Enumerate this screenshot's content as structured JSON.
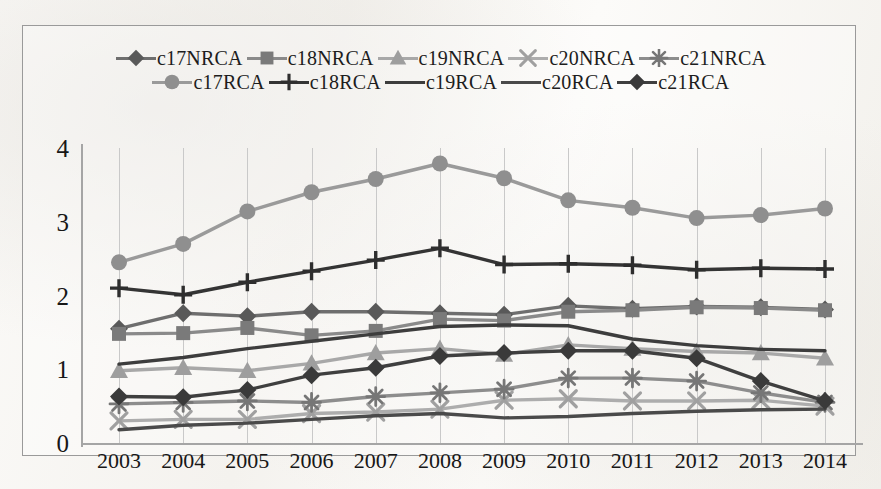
{
  "chart_data": {
    "type": "line",
    "title": "",
    "xlabel": "",
    "ylabel": "",
    "ylim": [
      0,
      4
    ],
    "yticks": [
      0,
      1,
      2,
      3,
      4
    ],
    "grid": "vertical",
    "legend_position": "top",
    "categories": [
      "2003",
      "2004",
      "2005",
      "2006",
      "2007",
      "2008",
      "2009",
      "2010",
      "2011",
      "2012",
      "2013",
      "2014"
    ],
    "series": [
      {
        "name": "c17NRCA",
        "marker": "diamond",
        "color": "#595959",
        "line_color": "#6e6e6e",
        "values": [
          1.55,
          1.76,
          1.72,
          1.78,
          1.78,
          1.76,
          1.74,
          1.86,
          1.82,
          1.85,
          1.84,
          1.81
        ]
      },
      {
        "name": "c18NRCA",
        "marker": "square",
        "color": "#7a7a7a",
        "line_color": "#8a8a8a",
        "values": [
          1.48,
          1.49,
          1.56,
          1.46,
          1.52,
          1.68,
          1.66,
          1.78,
          1.8,
          1.84,
          1.83,
          1.8
        ]
      },
      {
        "name": "c19NRCA",
        "marker": "triangle",
        "color": "#9e9e9e",
        "line_color": "#a8a8a8",
        "values": [
          0.98,
          1.02,
          0.98,
          1.08,
          1.22,
          1.28,
          1.2,
          1.33,
          1.28,
          1.24,
          1.22,
          1.15
        ]
      },
      {
        "name": "c20NRCA",
        "marker": "x",
        "color": "#a0a0a0",
        "line_color": "#adadad",
        "values": [
          0.3,
          0.32,
          0.32,
          0.4,
          0.42,
          0.46,
          0.58,
          0.6,
          0.57,
          0.57,
          0.58,
          0.5
        ]
      },
      {
        "name": "c21NRCA",
        "marker": "asterisk",
        "color": "#767676",
        "line_color": "#8d8d8d",
        "values": [
          0.53,
          0.55,
          0.57,
          0.55,
          0.63,
          0.68,
          0.73,
          0.88,
          0.88,
          0.84,
          0.68,
          0.55
        ]
      },
      {
        "name": "c17RCA",
        "marker": "circle",
        "color": "#8f8f8f",
        "line_color": "#9a9a9a",
        "values": [
          2.45,
          2.7,
          3.14,
          3.4,
          3.58,
          3.79,
          3.59,
          3.29,
          3.19,
          3.05,
          3.09,
          3.18
        ]
      },
      {
        "name": "c18RCA",
        "marker": "plus",
        "color": "#2e2e2e",
        "line_color": "#343434",
        "values": [
          2.1,
          2.01,
          2.18,
          2.33,
          2.48,
          2.64,
          2.42,
          2.43,
          2.41,
          2.35,
          2.37,
          2.36
        ]
      },
      {
        "name": "c19RCA",
        "marker": "none",
        "color": "#3d3d3d",
        "line_color": "#3d3d3d",
        "values": [
          1.07,
          1.16,
          1.28,
          1.38,
          1.48,
          1.58,
          1.6,
          1.59,
          1.41,
          1.32,
          1.27,
          1.25
        ]
      },
      {
        "name": "c20RCA",
        "marker": "none",
        "color": "#4a4a4a",
        "line_color": "#4a4a4a",
        "values": [
          0.18,
          0.24,
          0.27,
          0.32,
          0.37,
          0.4,
          0.34,
          0.36,
          0.4,
          0.43,
          0.45,
          0.46
        ]
      },
      {
        "name": "c21RCA",
        "marker": "diamond",
        "color": "#3a3a3a",
        "line_color": "#3f3f3f",
        "values": [
          0.63,
          0.62,
          0.72,
          0.92,
          1.02,
          1.18,
          1.22,
          1.25,
          1.25,
          1.15,
          0.84,
          0.57
        ]
      }
    ]
  },
  "legend": {
    "row1": [
      "c17NRCA",
      "c18NRCA",
      "c19NRCA",
      "c20NRCA",
      "c21NRCA"
    ],
    "row2": [
      "c17RCA",
      "c18RCA",
      "c19RCA",
      "c20RCA",
      "c21RCA"
    ]
  },
  "axis": {
    "y_ticks": [
      "4",
      "3",
      "2",
      "1",
      "0"
    ],
    "x_ticks": [
      "2003",
      "2004",
      "2005",
      "2006",
      "2007",
      "2008",
      "2009",
      "2010",
      "2011",
      "2012",
      "2013",
      "2014"
    ]
  }
}
